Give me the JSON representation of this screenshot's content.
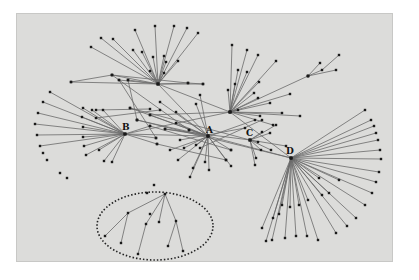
{
  "diagram": {
    "type": "network-graph",
    "background": "#dcdcda",
    "edge_color": "#6a6a6a",
    "node_color": "#1a1a1a",
    "hubs": [
      {
        "id": "T",
        "label": "",
        "x": 158,
        "y": 84
      },
      {
        "id": "B",
        "label": "B",
        "x": 125,
        "y": 134,
        "lx": 122,
        "ly": 130
      },
      {
        "id": "A",
        "label": "A",
        "x": 208,
        "y": 136,
        "lx": 206,
        "ly": 133
      },
      {
        "id": "C",
        "label": "C",
        "x": 250,
        "y": 140,
        "lx": 246,
        "ly": 136
      },
      {
        "id": "U",
        "label": "",
        "x": 230,
        "y": 112
      },
      {
        "id": "D",
        "label": "D",
        "x": 291,
        "y": 158,
        "lx": 286,
        "ly": 154
      }
    ],
    "ellipse": {
      "cx": 155,
      "cy": 226,
      "rx": 58,
      "ry": 34
    },
    "spokes": {
      "T": [
        [
          135,
          30
        ],
        [
          155,
          26
        ],
        [
          174,
          26
        ],
        [
          187,
          28
        ],
        [
          198,
          33
        ],
        [
          101,
          38
        ],
        [
          113,
          39
        ],
        [
          91,
          47
        ],
        [
          133,
          50
        ],
        [
          142,
          52
        ],
        [
          153,
          57
        ],
        [
          164,
          56
        ],
        [
          166,
          62
        ],
        [
          178,
          61
        ],
        [
          150,
          71
        ],
        [
          164,
          73
        ],
        [
          71,
          82
        ],
        [
          112,
          75
        ],
        [
          119,
          80
        ],
        [
          128,
          80
        ],
        [
          188,
          83
        ],
        [
          203,
          84
        ]
      ],
      "B": [
        [
          50,
          92
        ],
        [
          43,
          102
        ],
        [
          38,
          113
        ],
        [
          35,
          124
        ],
        [
          37,
          135
        ],
        [
          40,
          146
        ],
        [
          83,
          108
        ],
        [
          92,
          110
        ],
        [
          103,
          110
        ],
        [
          82,
          117
        ],
        [
          83,
          127
        ],
        [
          83,
          137
        ],
        [
          84,
          146
        ],
        [
          86,
          155
        ],
        [
          99,
          150
        ],
        [
          104,
          161
        ],
        [
          112,
          162
        ],
        [
          150,
          126
        ],
        [
          156,
          138
        ],
        [
          157,
          144
        ]
      ],
      "A": [
        [
          130,
          108
        ],
        [
          137,
          120
        ],
        [
          150,
          115
        ],
        [
          160,
          102
        ],
        [
          165,
          129
        ],
        [
          176,
          112
        ],
        [
          176,
          123
        ],
        [
          196,
          104
        ],
        [
          200,
          95
        ],
        [
          189,
          130
        ],
        [
          178,
          160
        ],
        [
          193,
          168
        ],
        [
          190,
          177
        ],
        [
          205,
          162
        ],
        [
          209,
          170
        ],
        [
          226,
          160
        ],
        [
          231,
          166
        ],
        [
          231,
          150
        ],
        [
          196,
          145
        ],
        [
          184,
          148
        ]
      ],
      "U": [
        [
          232,
          45
        ],
        [
          247,
          50
        ],
        [
          258,
          55
        ],
        [
          276,
          61
        ],
        [
          238,
          70
        ],
        [
          247,
          72
        ],
        [
          259,
          82
        ],
        [
          254,
          93
        ],
        [
          235,
          84
        ],
        [
          228,
          90
        ],
        [
          258,
          98
        ],
        [
          270,
          103
        ],
        [
          290,
          94
        ],
        [
          308,
          76
        ],
        [
          238,
          110
        ],
        [
          260,
          116
        ],
        [
          273,
          125
        ],
        [
          282,
          113
        ],
        [
          300,
          116
        ]
      ],
      "C": [
        [
          262,
          132
        ],
        [
          270,
          133
        ],
        [
          258,
          142
        ],
        [
          271,
          150
        ],
        [
          286,
          146
        ],
        [
          276,
          125
        ],
        [
          256,
          158
        ],
        [
          261,
          150
        ],
        [
          255,
          165
        ]
      ],
      "D": [
        [
          365,
          110
        ],
        [
          371,
          120
        ],
        [
          374,
          126
        ],
        [
          376,
          133
        ],
        [
          378,
          140
        ],
        [
          380,
          150
        ],
        [
          381,
          159
        ],
        [
          379,
          172
        ],
        [
          376,
          182
        ],
        [
          372,
          193
        ],
        [
          365,
          205
        ],
        [
          356,
          218
        ],
        [
          347,
          226
        ],
        [
          336,
          233
        ],
        [
          318,
          240
        ],
        [
          307,
          236
        ],
        [
          296,
          236
        ],
        [
          285,
          238
        ],
        [
          272,
          240
        ],
        [
          266,
          241
        ],
        [
          262,
          228
        ],
        [
          273,
          218
        ],
        [
          279,
          214
        ],
        [
          282,
          205
        ],
        [
          290,
          207
        ],
        [
          299,
          205
        ],
        [
          308,
          200
        ],
        [
          322,
          195
        ],
        [
          329,
          193
        ],
        [
          319,
          178
        ],
        [
          339,
          180
        ]
      ]
    },
    "secondary_edges": [
      [
        [
          71,
          82
        ],
        [
          112,
          75
        ],
        [
          188,
          83
        ],
        [
          203,
          84
        ]
      ],
      [
        [
          128,
          80
        ],
        [
          137,
          120
        ]
      ],
      [
        [
          119,
          80
        ],
        [
          156,
          138
        ]
      ],
      [
        [
          112,
          75
        ],
        [
          189,
          130
        ]
      ],
      [
        [
          150,
          115
        ],
        [
          230,
          112
        ]
      ],
      [
        [
          130,
          108
        ],
        [
          250,
          140
        ]
      ],
      [
        [
          137,
          120
        ],
        [
          291,
          158
        ]
      ],
      [
        [
          165,
          129
        ],
        [
          250,
          140
        ]
      ],
      [
        [
          150,
          126
        ],
        [
          231,
          150
        ]
      ],
      [
        [
          157,
          144
        ],
        [
          226,
          160
        ]
      ],
      [
        [
          125,
          134
        ],
        [
          230,
          112
        ]
      ],
      [
        [
          125,
          134
        ],
        [
          208,
          136
        ]
      ],
      [
        [
          158,
          84
        ],
        [
          208,
          136
        ]
      ],
      [
        [
          158,
          84
        ],
        [
          230,
          112
        ]
      ],
      [
        [
          208,
          136
        ],
        [
          291,
          158
        ]
      ],
      [
        [
          230,
          112
        ],
        [
          291,
          158
        ]
      ],
      [
        [
          308,
          76
        ],
        [
          322,
          70
        ],
        [
          339,
          55
        ]
      ],
      [
        [
          308,
          76
        ],
        [
          336,
          70
        ]
      ],
      [
        [
          308,
          76
        ],
        [
          320,
          63
        ]
      ],
      [
        [
          96,
          110
        ],
        [
          150,
          109
        ]
      ],
      [
        [
          96,
          118
        ],
        [
          160,
          110
        ]
      ],
      [
        [
          170,
          150
        ],
        [
          255,
          120
        ]
      ],
      [
        [
          180,
          140
        ],
        [
          245,
          128
        ]
      ],
      [
        [
          200,
          148
        ],
        [
          262,
          120
        ]
      ]
    ],
    "isolated_nodes": [
      [
        43,
        153
      ],
      [
        47,
        160
      ],
      [
        60,
        173
      ],
      [
        67,
        178
      ],
      [
        147,
        193
      ],
      [
        154,
        185
      ]
    ],
    "tree_in_ellipse": {
      "root": [
        165,
        194
      ],
      "edges": [
        [
          [
            165,
            194
          ],
          [
            128,
            213
          ]
        ],
        [
          [
            128,
            213
          ],
          [
            105,
            236
          ]
        ],
        [
          [
            128,
            213
          ],
          [
            121,
            243
          ]
        ],
        [
          [
            165,
            194
          ],
          [
            146,
            224
          ]
        ],
        [
          [
            146,
            224
          ],
          [
            138,
            254
          ]
        ],
        [
          [
            165,
            194
          ],
          [
            159,
            222
          ]
        ],
        [
          [
            165,
            194
          ],
          [
            176,
            221
          ]
        ],
        [
          [
            176,
            221
          ],
          [
            168,
            246
          ]
        ],
        [
          [
            176,
            221
          ],
          [
            183,
            251
          ]
        ]
      ],
      "nodes": [
        [
          165,
          194
        ],
        [
          128,
          213
        ],
        [
          105,
          236
        ],
        [
          121,
          243
        ],
        [
          146,
          224
        ],
        [
          138,
          254
        ],
        [
          159,
          222
        ],
        [
          176,
          221
        ],
        [
          168,
          246
        ],
        [
          183,
          251
        ],
        [
          150,
          214
        ]
      ]
    }
  }
}
